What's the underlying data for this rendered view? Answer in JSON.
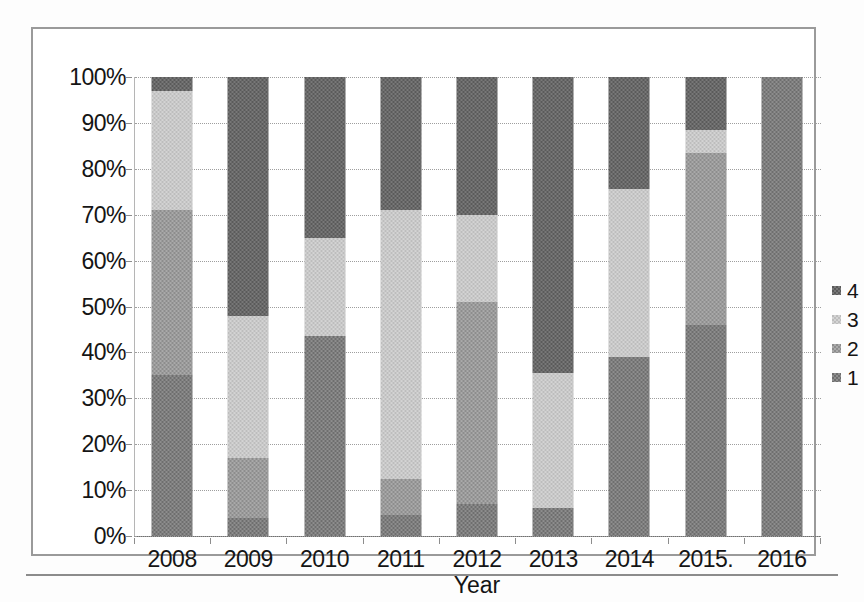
{
  "chart_data": {
    "type": "bar",
    "subtype": "stacked-100-percent",
    "title": "",
    "xlabel": "Year",
    "ylabel": "",
    "ylim": [
      0,
      100
    ],
    "ytick_labels": [
      "100%",
      "90%",
      "80%",
      "70%",
      "60%",
      "50%",
      "40%",
      "30%",
      "20%",
      "10%",
      "0%"
    ],
    "ytick_values": [
      100,
      90,
      80,
      70,
      60,
      50,
      40,
      30,
      20,
      10,
      0
    ],
    "grid": true,
    "grid_style": "dotted-horizontal",
    "legend_position": "right",
    "legend_entries": [
      "4",
      "3",
      "2",
      "1"
    ],
    "categories": [
      "2008",
      "2009",
      "2010",
      "2011",
      "2012",
      "2013",
      "2014",
      "2015.",
      "2016"
    ],
    "series": [
      {
        "name": "1",
        "color": "#6e6e6e",
        "values": [
          35,
          4,
          43.5,
          4.5,
          7,
          6,
          39,
          46,
          100
        ]
      },
      {
        "name": "2",
        "color": "#8d8d8d",
        "values": [
          36,
          13,
          0,
          8,
          44,
          0,
          0,
          37.5,
          0
        ]
      },
      {
        "name": "3",
        "color": "#bdbdbd",
        "values": [
          26,
          31,
          21.5,
          58.5,
          19,
          29.5,
          36.5,
          5,
          0
        ]
      },
      {
        "name": "4",
        "color": "#5a5a5a",
        "values": [
          3,
          52,
          35,
          29,
          30,
          64.5,
          24.5,
          11.5,
          0
        ]
      }
    ],
    "stack_boundaries_percent": {
      "2008": [
        0,
        35,
        71,
        97,
        100
      ],
      "2009": [
        0,
        4,
        17,
        48,
        100
      ],
      "2010": [
        0,
        43.5,
        43.5,
        65,
        100
      ],
      "2011": [
        0,
        4.5,
        12.5,
        71,
        100
      ],
      "2012": [
        0,
        7,
        51,
        70,
        100
      ],
      "2013": [
        0,
        6,
        6,
        35.5,
        100
      ],
      "2014": [
        0,
        39,
        39,
        75.5,
        100
      ],
      "2015.": [
        0,
        46,
        83.5,
        88.5,
        100
      ],
      "2016": [
        0,
        100,
        100,
        100,
        100
      ]
    }
  },
  "legend": {
    "items": [
      {
        "label": "4",
        "fill": "fill-4"
      },
      {
        "label": "3",
        "fill": "fill-3"
      },
      {
        "label": "2",
        "fill": "fill-2"
      },
      {
        "label": "1",
        "fill": "fill-1"
      }
    ]
  },
  "axes": {
    "x_title": "Year"
  }
}
